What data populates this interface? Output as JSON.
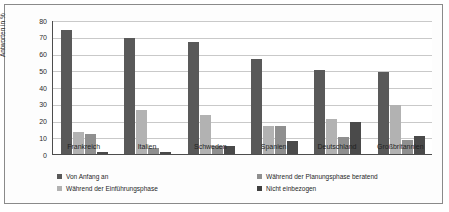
{
  "chart_data": {
    "type": "bar",
    "title": "",
    "xlabel": "",
    "ylabel": "Antworten in %",
    "ylim": [
      0,
      80
    ],
    "ytick_step": 10,
    "yticks": [
      "80",
      "70",
      "60",
      "50",
      "40",
      "30",
      "20",
      "10",
      "0"
    ],
    "grid": true,
    "legend_position": "bottom",
    "categories": [
      "Frankreich",
      "Italien",
      "Schweden",
      "Spanien",
      "Deutschland",
      "Großbritannien"
    ],
    "series": [
      {
        "name": "Von Anfang an",
        "color": "#595959",
        "values": [
          74,
          69,
          67,
          57,
          50,
          49
        ]
      },
      {
        "name": "Während der Planungsphase beratend",
        "color": "#8f8f8f",
        "values": [
          13,
          26,
          23.5,
          17,
          21,
          29.5
        ]
      },
      {
        "name": "Während der Einführungsphase",
        "color": "#b2b2b2",
        "values": [
          12,
          3.5,
          4.5,
          17,
          10,
          8.5
        ]
      },
      {
        "name": "Nicht einbezogen",
        "color": "#3f3f3f",
        "values": [
          1.5,
          1.5,
          4.5,
          8,
          19,
          10.5
        ]
      }
    ]
  }
}
